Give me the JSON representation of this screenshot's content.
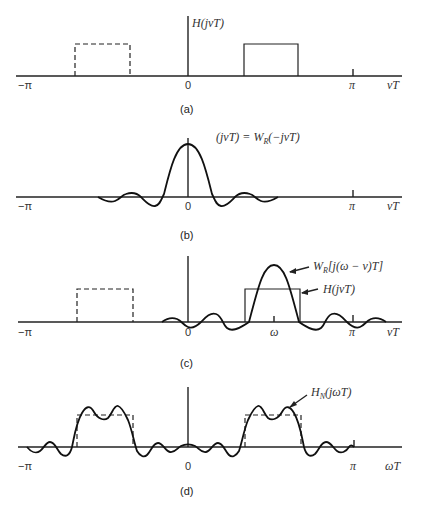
{
  "panels": {
    "a": {
      "caption": "(a)",
      "function_label": "H(jνT)",
      "x_labels": {
        "neg_pi": "−π",
        "zero": "0",
        "pi": "π",
        "axis": "νT"
      }
    },
    "b": {
      "caption": "(b)",
      "function_label": "W_R(jνT) = W_R(−jνT)",
      "function_label_parts": {
        "w1": "W",
        "s1": "R",
        "m1": "(jνT) = ",
        "w2": "W",
        "s2": "R",
        "m2": "(−jνT)"
      },
      "x_labels": {
        "neg_pi": "−π",
        "zero": "0",
        "pi": "π",
        "axis": "νT"
      }
    },
    "c": {
      "caption": "(c)",
      "window_label_parts": {
        "w": "W",
        "s": "R",
        "m": "[j(ω − ν)T]"
      },
      "filter_label": "H(jνT)",
      "x_labels": {
        "neg_pi": "−π",
        "zero": "0",
        "omega": "ω",
        "pi": "π",
        "axis": "νT"
      }
    },
    "d": {
      "caption": "(d)",
      "result_label_parts": {
        "w": "H",
        "s": "N",
        "m": "(jωT)"
      },
      "x_labels": {
        "neg_pi": "−π",
        "zero": "0",
        "pi": "π",
        "axis": "ωT"
      }
    }
  }
}
